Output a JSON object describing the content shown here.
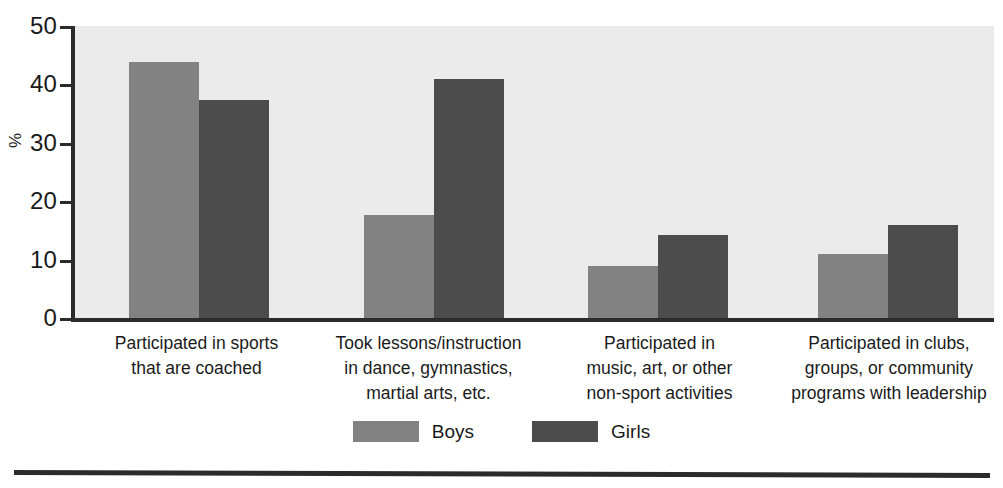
{
  "chart_data": {
    "type": "bar",
    "title": "",
    "xlabel": "",
    "ylabel": "%",
    "ylim": [
      0,
      50
    ],
    "yticks": [
      "0",
      "10",
      "20",
      "30",
      "40",
      "50"
    ],
    "grid": false,
    "legend_position": "bottom-center",
    "categories": [
      "Participated in sports\nthat are coached",
      "Took lessons/instruction\nin dance, gymnastics,\nmartial arts, etc.",
      "Participated in\nmusic, art, or other\nnon-sport activities",
      "Participated in clubs,\ngroups, or community\nprograms with leadership"
    ],
    "series": [
      {
        "name": "Boys",
        "color": "#828282",
        "values": [
          44.2,
          18.0,
          9.3,
          11.3
        ]
      },
      {
        "name": "Girls",
        "color": "#4c4c4c",
        "values": [
          37.7,
          41.3,
          14.6,
          16.2
        ]
      }
    ]
  },
  "axis": {
    "y_title": "%",
    "ticks": [
      {
        "label": "50",
        "value": 50
      },
      {
        "label": "40",
        "value": 40
      },
      {
        "label": "30",
        "value": 30
      },
      {
        "label": "20",
        "value": 20
      },
      {
        "label": "10",
        "value": 10
      },
      {
        "label": "0",
        "value": 0
      }
    ]
  },
  "categories": [
    {
      "lines": [
        "Participated in sports",
        "that are coached"
      ]
    },
    {
      "lines": [
        "Took lessons/instruction",
        "in dance, gymnastics,",
        "martial arts, etc."
      ]
    },
    {
      "lines": [
        "Participated in",
        "music, art, or other",
        "non-sport activities"
      ]
    },
    {
      "lines": [
        "Participated in clubs,",
        "groups, or community",
        "programs with leadership"
      ]
    }
  ],
  "legend": {
    "items": [
      {
        "label": "Boys",
        "color": "#828282"
      },
      {
        "label": "Girls",
        "color": "#4c4c4c"
      }
    ]
  },
  "colors": {
    "boys": "#828282",
    "girls": "#4c4c4c",
    "plot_background": "#ebebeb",
    "axis": "#2b2b2b",
    "page_background": "#ffffff"
  }
}
